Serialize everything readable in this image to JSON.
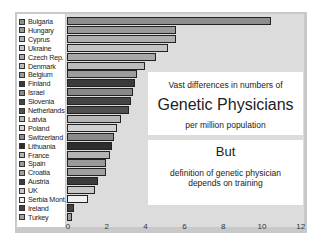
{
  "chart_data": {
    "type": "bar",
    "orientation": "horizontal",
    "title": "Vast differences in numbers of Genetic Physicians per million population",
    "xlabel": "",
    "ylabel": "",
    "xlim": [
      0,
      12
    ],
    "x_ticks": [
      "0",
      "2",
      "4",
      "6",
      "8",
      "10",
      "12"
    ],
    "grid": false,
    "legend_position": "left",
    "categories": [
      "Bulgaria",
      "Hungary",
      "Cyprus",
      "Ukraine",
      "Czech Rep.",
      "Denmark",
      "Belgium",
      "Finland",
      "Israel",
      "Slovenia",
      "Netherlands",
      "Latvia",
      "Poland",
      "Switzerland",
      "Lithuania",
      "France",
      "Spain",
      "Croatia",
      "Austria",
      "UK",
      "Serbia Mont.",
      "Ireland",
      "Turkey"
    ],
    "values": [
      10.5,
      5.6,
      5.6,
      5.2,
      4.6,
      4.0,
      3.6,
      3.5,
      3.4,
      3.3,
      3.2,
      2.8,
      2.6,
      2.4,
      2.3,
      2.2,
      2.0,
      2.0,
      1.6,
      1.45,
      1.1,
      0.35,
      0.25
    ],
    "colors": [
      "#8e8e8e",
      "#9a9a9a",
      "#b0b0b0",
      "#c4c4c4",
      "#a8a8a8",
      "#bcbcbc",
      "#9c9c9c",
      "#3a3a3a",
      "#888888",
      "#454545",
      "#505050",
      "#b8b8b8",
      "#d2d2d2",
      "#8a8a8a",
      "#2e2e2e",
      "#b4b4b4",
      "#9a9a9a",
      "#a0a0a0",
      "#3c3c3c",
      "#c8c8c8",
      "#f0f0f0",
      "#444444",
      "#a0a0a0"
    ],
    "annotations": [
      "Vast differences in numbers of",
      "Genetic Physicians",
      "per million population",
      "But",
      "definition of genetic physician",
      "depends on training"
    ]
  },
  "textbox1": {
    "line1": "Vast differences in numbers of",
    "line2": "Genetic Physicians",
    "line3": "per million population"
  },
  "textbox2": {
    "line1": "But",
    "line2": "definition of genetic physician",
    "line3": "depends on training"
  }
}
